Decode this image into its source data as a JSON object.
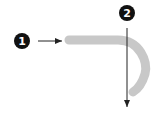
{
  "diagram": {
    "callouts": [
      {
        "id": "callout-1",
        "label": "1",
        "points_to": "path-start"
      },
      {
        "id": "callout-2",
        "label": "2",
        "points_to": "downward-direction"
      }
    ],
    "colors": {
      "path": "#c8c8c8",
      "callout_fill": "#111111",
      "callout_text": "#ffffff",
      "arrow": "#222222",
      "background": "#ffffff"
    }
  }
}
